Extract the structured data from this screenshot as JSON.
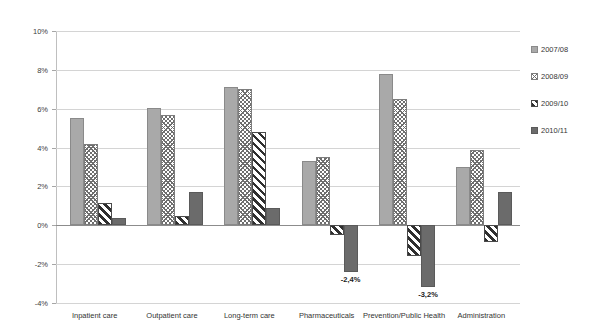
{
  "chart_data": {
    "type": "bar",
    "title": "",
    "subtitle": "",
    "xlabel": "",
    "ylabel": "",
    "ylim": [
      -4,
      10
    ],
    "ytick_values": [
      10,
      8,
      6,
      4,
      2,
      0,
      -2,
      -4
    ],
    "ytick_labels": [
      "10%",
      "8%",
      "6%",
      "4%",
      "2%",
      "0%",
      "-2%",
      "-4%"
    ],
    "grid": true,
    "legend_position": "right",
    "categories": [
      "Inpatient care",
      "Outpatient care",
      "Long-term care",
      "Pharmaceuticals",
      "Prevention/Public Health",
      "Administration"
    ],
    "series": [
      {
        "name": "2007/08",
        "pattern": "solid-light-gray",
        "color": "#a9a9a9",
        "values": [
          5.5,
          6.05,
          7.1,
          3.3,
          7.8,
          3.0
        ]
      },
      {
        "name": "2008/09",
        "pattern": "cross-hatch",
        "color": "#6e6e6e",
        "values": [
          4.2,
          5.7,
          7.0,
          3.5,
          6.5,
          3.85
        ]
      },
      {
        "name": "2009/10",
        "pattern": "diagonal-stripes",
        "color": "#2f2f2f",
        "values": [
          1.15,
          0.5,
          4.8,
          -0.5,
          -1.6,
          -0.85
        ]
      },
      {
        "name": "2010/11",
        "pattern": "solid-dark-gray",
        "color": "#6b6b6b",
        "values": [
          0.35,
          1.7,
          0.9,
          -2.4,
          -3.2,
          1.7
        ]
      }
    ],
    "data_labels": [
      {
        "category": "Pharmaceuticals",
        "series": "2010/11",
        "text": "-2,4%"
      },
      {
        "category": "Prevention/Public Health",
        "series": "2010/11",
        "text": "-3,2%"
      }
    ]
  },
  "legend": {
    "items": [
      {
        "label": "2007/08",
        "swatch": "legend-swatch-2007-08"
      },
      {
        "label": "2008/09",
        "swatch": "legend-swatch-2008-09"
      },
      {
        "label": "2009/10",
        "swatch": "legend-swatch-2009-10"
      },
      {
        "label": "2010/11",
        "swatch": "legend-swatch-2010-11"
      }
    ]
  }
}
